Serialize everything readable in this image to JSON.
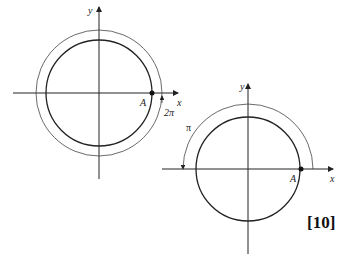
{
  "figures": [
    {
      "id": "left",
      "axis_labels": {
        "x": "x",
        "y": "y"
      },
      "point_label": "A",
      "angle_label": "2π",
      "center": [
        99,
        93
      ],
      "inner_radius": 53,
      "outer_radius": 63
    },
    {
      "id": "right",
      "axis_labels": {
        "x": "x",
        "y": "y"
      },
      "point_label": "A",
      "angle_label": "π",
      "center": [
        248,
        169
      ],
      "inner_radius": 52,
      "outer_radius": 65
    }
  ],
  "marks": "[10]"
}
